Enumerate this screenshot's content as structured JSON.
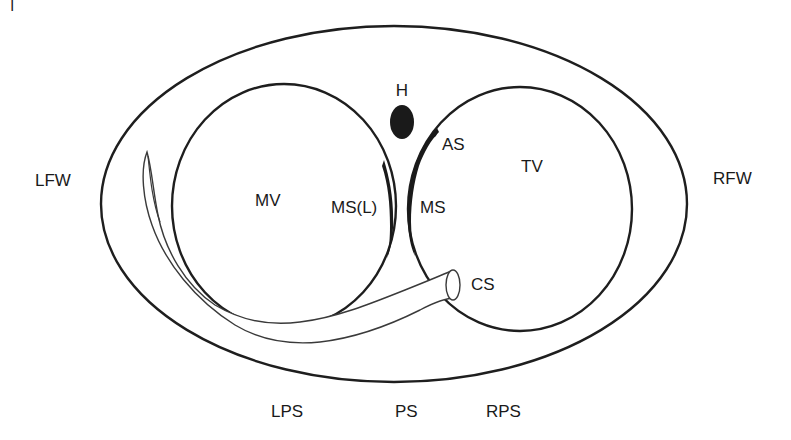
{
  "diagram": {
    "corner_mark": "|",
    "colors": {
      "line": "#1e1e1e",
      "septum_fill": "#1a1a1a",
      "background": "#ffffff"
    },
    "labels": {
      "his_bundle": "H",
      "aortic_side": "AS",
      "tricuspid_valve": "TV",
      "mitral_valve": "MV",
      "mitral_septum_left": "MS(L)",
      "mitral_septum": "MS",
      "coronary_sinus": "CS",
      "left_free_wall": "LFW",
      "right_free_wall": "RFW",
      "left_posteroseptal": "LPS",
      "posteroseptal": "PS",
      "right_posteroseptal": "RPS"
    },
    "shapes": {
      "outer_annulus": {
        "cx": 394,
        "cy": 204,
        "rx": 293,
        "ry": 178
      },
      "mitral_ring": {
        "cx": 284,
        "cy": 206,
        "rx": 112,
        "ry": 122
      },
      "tricuspid_ring": {
        "cx": 520,
        "cy": 209,
        "rx": 112,
        "ry": 122
      },
      "his_marker": {
        "cx": 402,
        "cy": 122,
        "rx": 12,
        "ry": 17
      },
      "cs_ostium": {
        "cx": 453,
        "cy": 285,
        "rx": 7,
        "ry": 15
      }
    }
  }
}
